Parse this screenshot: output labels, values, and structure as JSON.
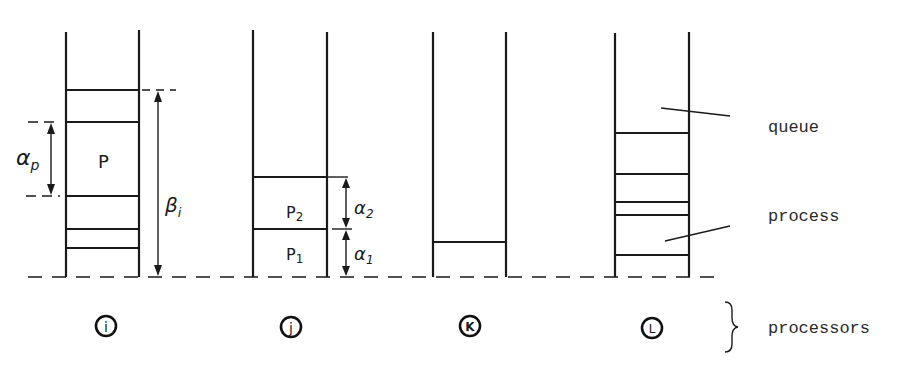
{
  "figure": {
    "type": "processor queue diagram",
    "baseline_style": "dashed"
  },
  "columns": [
    {
      "id": "i",
      "label": "i",
      "x_left": 66,
      "x_right": 139,
      "partitions_y": [
        90,
        122,
        196,
        229,
        248
      ],
      "process_label": "P",
      "annotations": {
        "alpha_label": "α",
        "alpha_sub": "p",
        "beta_label": "β",
        "beta_sub": "i"
      }
    },
    {
      "id": "j",
      "label": "j",
      "x_left": 253,
      "x_right": 327,
      "partitions_y": [
        177,
        229
      ],
      "process_labels": [
        {
          "main": "P",
          "sub": "2"
        },
        {
          "main": "P",
          "sub": "1"
        }
      ],
      "annotations": {
        "alpha2_label": "α",
        "alpha2_sub": "2",
        "alpha1_label": "α",
        "alpha1_sub": "1"
      }
    },
    {
      "id": "k",
      "label": "K",
      "x_left": 433,
      "x_right": 506,
      "partitions_y": [
        242
      ]
    },
    {
      "id": "l",
      "label": "L",
      "x_left": 615,
      "x_right": 689,
      "partitions_y": [
        133,
        174,
        202,
        215,
        255
      ]
    }
  ],
  "legend": {
    "queue": "queue",
    "process": "process",
    "processors": "processors"
  }
}
